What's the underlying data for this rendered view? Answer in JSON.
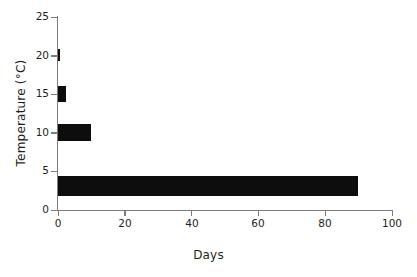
{
  "chart_data": {
    "type": "bar",
    "orientation": "horizontal",
    "title": "",
    "subtitle": "",
    "xlabel": "Days",
    "ylabel": "Temperature (°C)",
    "xlim": [
      0,
      100
    ],
    "ylim": [
      0,
      25
    ],
    "xticks": [
      0,
      20,
      40,
      60,
      80,
      100
    ],
    "xtick_labels": [
      "0",
      "20",
      "40",
      "60",
      "80",
      "100"
    ],
    "yticks": [
      0,
      5,
      10,
      15,
      20,
      25
    ],
    "ytick_labels": [
      "0",
      "5",
      "10",
      "15",
      "20",
      "25"
    ],
    "grid": false,
    "legend": false,
    "bar_color": "#0d0d0d",
    "axis_color": "#7d7d7d",
    "background": "#ffffff",
    "categories": [
      20,
      15,
      10,
      3
    ],
    "values": [
      0.5,
      2.5,
      10,
      90
    ],
    "bars": [
      {
        "temperature": 20,
        "days": 0.5,
        "thickness_deg": 1.6
      },
      {
        "temperature": 15,
        "days": 2.5,
        "thickness_deg": 2.0
      },
      {
        "temperature": 10,
        "days": 10,
        "thickness_deg": 2.2
      },
      {
        "temperature": 3,
        "days": 90,
        "thickness_deg": 2.6
      }
    ]
  }
}
